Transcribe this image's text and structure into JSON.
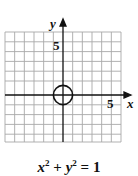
{
  "figure": {
    "axis_labels": {
      "x": "x",
      "y": "y"
    },
    "tick_labels": {
      "x": "5",
      "y": "5"
    },
    "equation": {
      "lhs_a": "x",
      "exp_a": "2",
      "plus": " + ",
      "lhs_b": "y",
      "exp_b": "2",
      "rhs": " = 1"
    },
    "grid": {
      "x_min": -6,
      "x_max": 6,
      "y_min": -5,
      "y_max": 6
    },
    "circle": {
      "center_x": 0,
      "center_y": 0,
      "radius": 1
    },
    "colors": {
      "grid": "#a8a8a8",
      "axis": "#111111",
      "curve": "#111111"
    }
  }
}
